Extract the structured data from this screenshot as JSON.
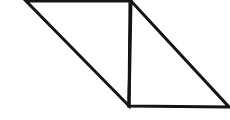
{
  "figure": {
    "background_color": "#ffffff",
    "stroke_color": "#141414",
    "fill_color": "#ffffff",
    "stroke_width": 3,
    "canvas": {
      "width": 230,
      "height": 120
    },
    "vertices": {
      "top_left": {
        "label": "A",
        "x": 26,
        "y": 1
      },
      "top_right": {
        "label": "B",
        "x": 131,
        "y": 1
      },
      "bottom_left": {
        "label": "C",
        "x": 129,
        "y": 106
      },
      "bottom_right": {
        "label": "D",
        "x": 229,
        "y": 107
      }
    },
    "shapes": [
      {
        "name": "left-triangle",
        "type": "polygon",
        "points": "26,1 131,1 129,106",
        "filled": false
      },
      {
        "name": "right-triangle",
        "type": "polygon",
        "points": "131,1 229,107 129,106",
        "filled": false
      }
    ],
    "divider": {
      "name": "vertical-divider",
      "type": "line",
      "x1": 130,
      "y1": 1,
      "x2": 129,
      "y2": 106
    }
  }
}
